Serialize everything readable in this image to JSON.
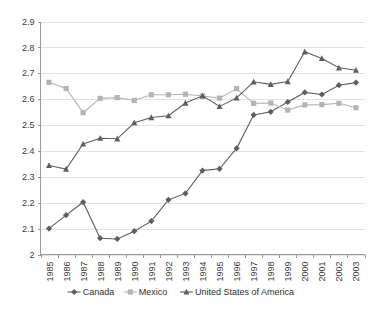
{
  "chart_data": {
    "type": "line",
    "title": "",
    "subtitle": "",
    "xlabel": "",
    "ylabel": "",
    "grid": true,
    "legend_position": "bottom",
    "ylim": [
      2.0,
      2.9
    ],
    "ytick_labels": [
      "2.9",
      "2.8",
      "2.7",
      "2.6",
      "2.5",
      "2.4",
      "2.3",
      "2.2",
      "2.1",
      "2"
    ],
    "ytick_values": [
      2.9,
      2.8,
      2.7,
      2.6,
      2.5,
      2.4,
      2.3,
      2.2,
      2.1,
      2.0
    ],
    "categories": [
      "1985",
      "1986",
      "1987",
      "1988",
      "1989",
      "1990",
      "1991",
      "1992",
      "1993",
      "1994",
      "1995",
      "1996",
      "1997",
      "1998",
      "1999",
      "2000",
      "2001",
      "2002",
      "2003"
    ],
    "series": [
      {
        "name": "Canada",
        "marker": "diamond",
        "color": "#5e5e5e",
        "values": [
          2.1,
          2.152,
          2.202,
          2.063,
          2.06,
          2.09,
          2.129,
          2.211,
          2.236,
          2.324,
          2.331,
          2.41,
          2.539,
          2.551,
          2.589,
          2.626,
          2.618,
          2.654,
          2.664
        ]
      },
      {
        "name": "Mexico",
        "marker": "square",
        "color": "#b4b4b4",
        "values": [
          2.665,
          2.641,
          2.548,
          2.603,
          2.606,
          2.595,
          2.617,
          2.617,
          2.619,
          2.612,
          2.604,
          2.641,
          2.584,
          2.585,
          2.558,
          2.578,
          2.579,
          2.584,
          2.567
        ]
      },
      {
        "name": "United States of America",
        "marker": "triangle",
        "color": "#5e5e5e",
        "values": [
          2.344,
          2.33,
          2.427,
          2.449,
          2.447,
          2.509,
          2.529,
          2.536,
          2.585,
          2.613,
          2.572,
          2.605,
          2.667,
          2.657,
          2.668,
          2.783,
          2.757,
          2.721,
          2.712
        ]
      }
    ]
  },
  "legend": {
    "items": [
      {
        "label": "Canada"
      },
      {
        "label": "Mexico"
      },
      {
        "label": "United States of America"
      }
    ]
  }
}
